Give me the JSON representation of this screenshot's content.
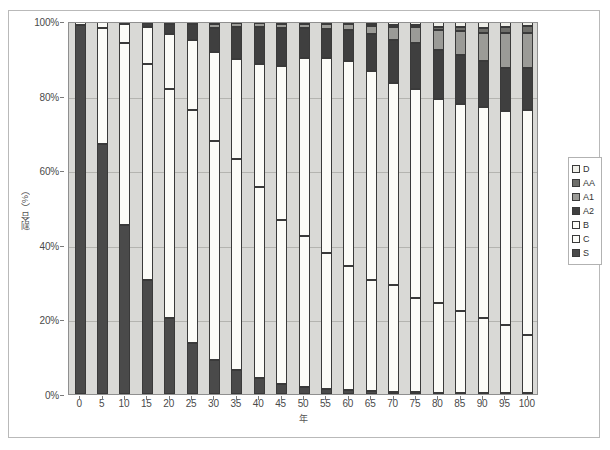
{
  "chart_data": {
    "type": "bar",
    "subtype": "stacked-percentage",
    "title": "",
    "xlabel": "年",
    "ylabel": "割合（%）",
    "ylim": [
      0,
      100
    ],
    "ytick_labels": [
      "0%",
      "20%",
      "40%",
      "60%",
      "80%",
      "100%"
    ],
    "ytick_values": [
      0,
      20,
      40,
      60,
      80,
      100
    ],
    "grid": true,
    "grid_axis": "y",
    "legend_position": "right",
    "categories": [
      "0",
      "5",
      "10",
      "15",
      "20",
      "25",
      "30",
      "35",
      "40",
      "45",
      "50",
      "55",
      "60",
      "65",
      "70",
      "75",
      "80",
      "85",
      "90",
      "95",
      "100"
    ],
    "stack_order_bottom_to_top": [
      "S",
      "C",
      "B",
      "A2",
      "A1",
      "AA",
      "D"
    ],
    "series": [
      {
        "name": "S",
        "color": "#4a4a4a",
        "values": [
          99.0,
          67.0,
          45.2,
          30.7,
          20.5,
          13.8,
          9.2,
          6.4,
          4.2,
          2.8,
          1.9,
          1.4,
          1.0,
          0.8,
          0.6,
          0.5,
          0.4,
          0.3,
          0.3,
          0.2,
          0.2
        ]
      },
      {
        "name": "C",
        "color": "#fcfcf8",
        "values": [
          0.0,
          31.2,
          48.9,
          57.7,
          61.2,
          62.3,
          58.6,
          56.6,
          51.2,
          43.9,
          40.4,
          36.5,
          33.2,
          29.8,
          28.7,
          25.3,
          24.0,
          21.9,
          20.1,
          18.2,
          15.6
        ]
      },
      {
        "name": "B",
        "color": "#fcfcf8",
        "values": [
          1.0,
          1.8,
          5.0,
          9.9,
          14.9,
          18.9,
          23.9,
          26.9,
          33.1,
          41.2,
          47.7,
          52.1,
          55.0,
          56.1,
          54.2,
          55.9,
          54.6,
          55.6,
          56.5,
          57.5,
          60.4
        ]
      },
      {
        "name": "A2",
        "color": "#3f3f3f",
        "values": [
          0.0,
          0.0,
          0.6,
          1.3,
          2.6,
          4.2,
          6.5,
          8.4,
          9.9,
          10.1,
          8.2,
          7.9,
          8.3,
          9.7,
          11.5,
          12.4,
          13.2,
          13.0,
          12.3,
          11.6,
          11.1
        ]
      },
      {
        "name": "A1",
        "color": "#9b9b97",
        "values": [
          0.0,
          0.0,
          0.0,
          0.2,
          0.4,
          0.5,
          1.0,
          1.1,
          1.0,
          1.2,
          1.1,
          1.3,
          1.7,
          2.3,
          3.4,
          4.2,
          5.3,
          6.6,
          7.6,
          9.3,
          9.5
        ]
      },
      {
        "name": "AA",
        "color": "#6e6e6a",
        "values": [
          0.0,
          0.0,
          0.0,
          0.0,
          0.1,
          0.1,
          0.2,
          0.2,
          0.2,
          0.3,
          0.3,
          0.3,
          0.3,
          0.4,
          0.5,
          0.6,
          0.8,
          1.0,
          1.3,
          1.6,
          1.8
        ]
      },
      {
        "name": "D",
        "color": "#efefe9",
        "values": [
          0.0,
          0.0,
          0.3,
          0.2,
          0.3,
          0.2,
          0.6,
          0.4,
          0.4,
          0.5,
          0.4,
          0.5,
          0.5,
          0.9,
          1.1,
          1.1,
          1.7,
          1.6,
          1.9,
          1.6,
          1.4
        ]
      }
    ],
    "legend_entries": [
      {
        "label": "D",
        "color": "#efefe9"
      },
      {
        "label": "AA",
        "color": "#6e6e6a"
      },
      {
        "label": "A1",
        "color": "#9b9b97"
      },
      {
        "label": "A2",
        "color": "#3f3f3f"
      },
      {
        "label": "B",
        "color": "#fcfcf8"
      },
      {
        "label": "C",
        "color": "#fcfcf8"
      },
      {
        "label": "S",
        "color": "#4a4a4a"
      }
    ],
    "plot_background": "#d9d9d6",
    "grid_color": "#b4b4b0",
    "axis_color": "#8f8f8f"
  }
}
